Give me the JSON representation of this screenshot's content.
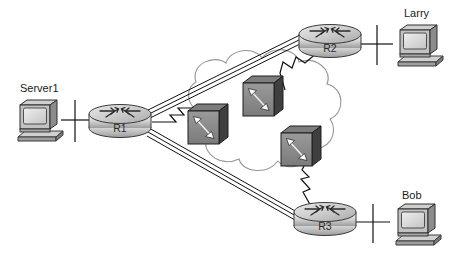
{
  "diagram": {
    "background_color": "#ffffff",
    "endpoints": [
      {
        "id": "server1",
        "label": "Server1",
        "icon": "desktop-computer-icon",
        "x": 47,
        "y": 120
      },
      {
        "id": "larry",
        "label": "Larry",
        "icon": "desktop-computer-icon",
        "x": 410,
        "y": 45
      },
      {
        "id": "bob",
        "label": "Bob",
        "icon": "desktop-computer-icon",
        "x": 410,
        "y": 228
      }
    ],
    "routers": [
      {
        "id": "r1",
        "label": "R1",
        "icon": "router-icon",
        "x": 120,
        "y": 120
      },
      {
        "id": "r2",
        "label": "R2",
        "icon": "router-icon",
        "x": 330,
        "y": 40
      },
      {
        "id": "r3",
        "label": "R3",
        "icon": "router-icon",
        "x": 325,
        "y": 218
      }
    ],
    "cloud": {
      "id": "wan-cloud",
      "label": "",
      "icon": "cloud-icon",
      "stroke_color": "#8a8a8a"
    },
    "switches": [
      {
        "id": "fr-switch-left",
        "icon": "frame-relay-switch-icon",
        "x": 207,
        "y": 125
      },
      {
        "id": "fr-switch-top",
        "icon": "frame-relay-switch-icon",
        "x": 262,
        "y": 97
      },
      {
        "id": "fr-switch-right",
        "icon": "frame-relay-switch-icon",
        "x": 300,
        "y": 147
      }
    ],
    "links": [
      {
        "id": "link-server1-r1",
        "from": "server1",
        "to": "r1",
        "style": "ethernet"
      },
      {
        "id": "link-larry-r2",
        "from": "larry",
        "to": "r2",
        "style": "ethernet"
      },
      {
        "id": "link-bob-r3",
        "from": "bob",
        "to": "r3",
        "style": "ethernet"
      },
      {
        "id": "link-r1-cloud",
        "from": "r1",
        "to": "fr-switch-left",
        "style": "serial"
      },
      {
        "id": "link-r2-cloud",
        "from": "r2",
        "to": "fr-switch-top",
        "style": "serial"
      },
      {
        "id": "link-r3-cloud",
        "from": "r3",
        "to": "fr-switch-right",
        "style": "serial"
      },
      {
        "id": "pvc-r1-r2",
        "from": "r1",
        "to": "r2",
        "style": "pvc"
      },
      {
        "id": "pvc-r1-r3",
        "from": "r1",
        "to": "r3",
        "style": "pvc"
      }
    ],
    "colors": {
      "line": "#111111",
      "cloud_outline": "#8f8f8f",
      "router_body_light": "#f2f2f2",
      "router_body_mid": "#c9c9c9",
      "router_body_dark": "#9a9a9a",
      "switch_face": "#8c8c8c",
      "switch_side": "#4a4a4a",
      "switch_top": "#6e6e6e",
      "screen": "#dcdcdc",
      "case": "#b8b8b8",
      "case_dark": "#6a6a6a",
      "text": "#1a1a1a"
    }
  }
}
